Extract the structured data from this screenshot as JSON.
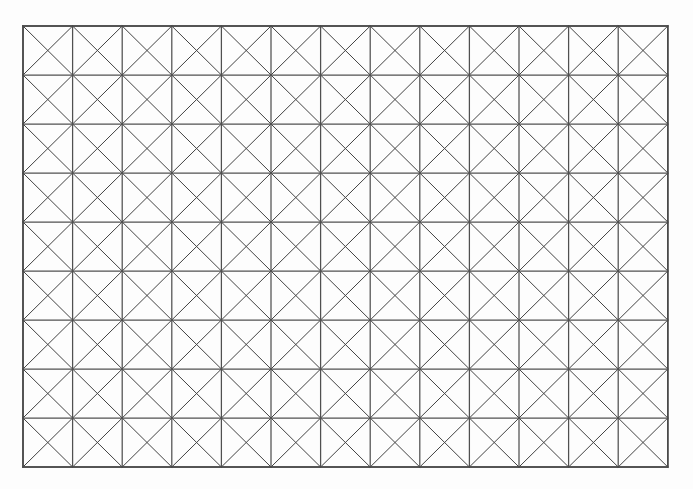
{
  "figure": {
    "background_color": "#fdfdfd",
    "line_color": "#3d3d3d",
    "frame_color": "#4a4a4a",
    "diagonal_color": "#434343",
    "major_color": "#505050",
    "canvas": {
      "width": 693,
      "height": 489
    }
  },
  "chart_data": {
    "type": "diagram",
    "subtitle": "",
    "xlabel": "",
    "ylabel": "",
    "grid": true,
    "legend": null,
    "annotations": [],
    "geometry": {
      "shape": "rectangular-grid-with-both-diagonals",
      "columns": 13,
      "rows": 9,
      "origin_x": 23,
      "origin_y": 26,
      "cell_width": 49.6,
      "cell_height": 49.0,
      "total_width": 645,
      "total_height": 441,
      "vertical_lines": 14,
      "horizontal_lines": 10,
      "diagonals_per_cell": 2,
      "total_cells": 117,
      "total_diagonal_segments": 234,
      "line_width": 1.05
    },
    "x": [
      23,
      72.6,
      122.2,
      171.8,
      221.4,
      271,
      320.6,
      370.2,
      419.8,
      469.4,
      519,
      568.6,
      618.2,
      667.8
    ],
    "y": [
      26,
      75,
      124,
      173,
      222,
      271,
      320,
      369,
      418,
      467
    ],
    "xlim": [
      23,
      667.8
    ],
    "ylim": [
      26,
      467
    ]
  }
}
